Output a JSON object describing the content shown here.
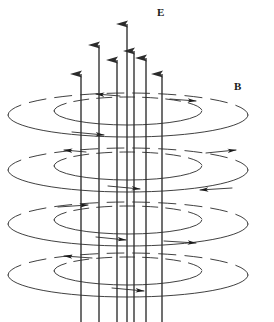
{
  "figure": {
    "width": 274,
    "height": 322,
    "background_color": "#ffffff",
    "stroke_color": "#2b2b2b",
    "labels": {
      "electric_field": "E",
      "magnetic_field": "B"
    }
  },
  "electric_field": {
    "name": "E",
    "direction": "up",
    "arrow_count": 7,
    "arrows": [
      {
        "x": 81,
        "y_tip": 62,
        "y_base": 322
      },
      {
        "x": 99,
        "y_tip": 33,
        "y_base": 322
      },
      {
        "x": 117,
        "y_tip": 48,
        "y_base": 322
      },
      {
        "x": 127,
        "y_tip": 12,
        "y_base": 322
      },
      {
        "x": 134,
        "y_tip": 39,
        "y_base": 322
      },
      {
        "x": 146,
        "y_tip": 46,
        "y_base": 322
      },
      {
        "x": 162,
        "y_tip": 62,
        "y_base": 322
      }
    ]
  },
  "magnetic_field": {
    "name": "B",
    "direction": "counterclockwise",
    "tier_count": 4,
    "rings_per_tier": 2,
    "center_x": 128,
    "tiers": [
      {
        "cy": 115,
        "outer_rx": 120,
        "outer_ry": 22,
        "inner_rx": 74,
        "inner_ry": 14
      },
      {
        "cy": 170,
        "outer_rx": 120,
        "outer_ry": 22,
        "inner_rx": 74,
        "inner_ry": 14
      },
      {
        "cy": 224,
        "outer_rx": 120,
        "outer_ry": 22,
        "inner_rx": 74,
        "inner_ry": 14
      },
      {
        "cy": 275,
        "outer_rx": 120,
        "outer_ry": 22,
        "inner_rx": 74,
        "inner_ry": 14
      }
    ]
  }
}
